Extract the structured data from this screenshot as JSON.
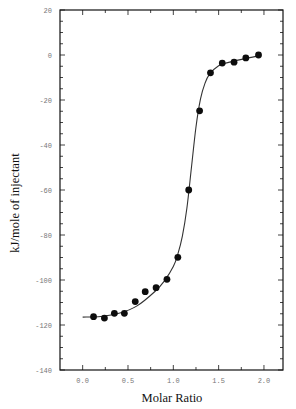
{
  "chart_data": {
    "type": "scatter",
    "title": "",
    "xlabel": "Molar Ratio",
    "ylabel": "kJ/mole of injectant",
    "xlim": [
      -0.25,
      2.21
    ],
    "ylim": [
      -140,
      20
    ],
    "x_ticks": [
      0.0,
      0.5,
      1.0,
      1.5,
      2.0
    ],
    "x_tick_labels": [
      "0.0",
      "0.5",
      "1.0",
      "1.5",
      "2.0"
    ],
    "x_minor_step": 0.25,
    "y_ticks": [
      20,
      0,
      -20,
      -40,
      -60,
      -80,
      -100,
      -120,
      -140
    ],
    "y_tick_labels": [
      "20",
      "0",
      "-20",
      "-40",
      "-60",
      "-80",
      "-100",
      "-120",
      "-140"
    ],
    "y_minor_step": 5,
    "grid": false,
    "legend": null,
    "series": [
      {
        "name": "Injection data",
        "style": "filled-circles",
        "x": [
          0.12,
          0.24,
          0.35,
          0.46,
          0.58,
          0.69,
          0.81,
          0.93,
          1.05,
          1.17,
          1.29,
          1.41,
          1.54,
          1.67,
          1.8,
          1.94
        ],
        "y": [
          -116.3,
          -116.9,
          -114.8,
          -114.8,
          -109.6,
          -105.2,
          -103.4,
          -99.7,
          -89.9,
          -60.0,
          -24.8,
          -7.9,
          -3.6,
          -3.2,
          -1.3,
          0.0
        ]
      },
      {
        "name": "Fit",
        "style": "line",
        "x": [
          0.0,
          0.2,
          0.4,
          0.6,
          0.8,
          0.9,
          1.0,
          1.05,
          1.1,
          1.15,
          1.2,
          1.25,
          1.3,
          1.35,
          1.4,
          1.5,
          1.6,
          1.7,
          1.8,
          1.94
        ],
        "y": [
          -116.5,
          -116.2,
          -114.8,
          -111.5,
          -105.0,
          -100.5,
          -94.0,
          -88.5,
          -80.5,
          -68.0,
          -50.0,
          -32.0,
          -19.5,
          -12.5,
          -8.5,
          -4.8,
          -3.4,
          -2.4,
          -1.5,
          -0.4
        ]
      }
    ]
  },
  "colors": {
    "axis": "#111111",
    "marker": "#0d0d0d",
    "fit_line": "#333333",
    "tick_label": "#777777"
  }
}
